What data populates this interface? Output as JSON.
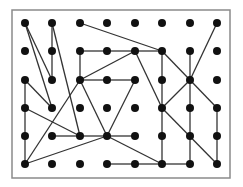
{
  "diagram": {
    "type": "grid-graph",
    "border": {
      "x": 12,
      "y": 10,
      "width": 218,
      "height": 168,
      "color": "#8a8a8a"
    },
    "node_color": "#111111",
    "edge_color": "#333333",
    "node_radius": 4,
    "columns": [
      25,
      52,
      80,
      107,
      135,
      162,
      190,
      217
    ],
    "rows": [
      23,
      51,
      80,
      108,
      136,
      164
    ],
    "edges": [
      [
        [
          0,
          0
        ],
        [
          1,
          2
        ]
      ],
      [
        [
          0,
          0
        ],
        [
          1,
          3
        ]
      ],
      [
        [
          1,
          0
        ],
        [
          1,
          1
        ]
      ],
      [
        [
          1,
          1
        ],
        [
          1,
          2
        ]
      ],
      [
        [
          1,
          0
        ],
        [
          2,
          4
        ]
      ],
      [
        [
          2,
          0
        ],
        [
          5,
          1
        ]
      ],
      [
        [
          2,
          1
        ],
        [
          3,
          1
        ]
      ],
      [
        [
          3,
          1
        ],
        [
          4,
          1
        ]
      ],
      [
        [
          4,
          1
        ],
        [
          5,
          1
        ]
      ],
      [
        [
          2,
          1
        ],
        [
          2,
          2
        ]
      ],
      [
        [
          2,
          2
        ],
        [
          3,
          2
        ]
      ],
      [
        [
          3,
          2
        ],
        [
          4,
          2
        ]
      ],
      [
        [
          2,
          2
        ],
        [
          4,
          1
        ]
      ],
      [
        [
          2,
          2
        ],
        [
          3,
          4
        ]
      ],
      [
        [
          2,
          2
        ],
        [
          0,
          5
        ]
      ],
      [
        [
          4,
          2
        ],
        [
          3,
          4
        ]
      ],
      [
        [
          4,
          1
        ],
        [
          5,
          3
        ]
      ],
      [
        [
          5,
          1
        ],
        [
          5,
          2
        ]
      ],
      [
        [
          5,
          2
        ],
        [
          5,
          3
        ]
      ],
      [
        [
          5,
          3
        ],
        [
          5,
          4
        ]
      ],
      [
        [
          5,
          4
        ],
        [
          5,
          5
        ]
      ],
      [
        [
          5,
          1
        ],
        [
          6,
          2
        ]
      ],
      [
        [
          7,
          0
        ],
        [
          6,
          2
        ]
      ],
      [
        [
          6,
          1
        ],
        [
          6,
          2
        ]
      ],
      [
        [
          6,
          2
        ],
        [
          6,
          3
        ]
      ],
      [
        [
          6,
          3
        ],
        [
          6,
          4
        ]
      ],
      [
        [
          6,
          4
        ],
        [
          6,
          5
        ]
      ],
      [
        [
          6,
          2
        ],
        [
          5,
          3
        ]
      ],
      [
        [
          6,
          2
        ],
        [
          7,
          3
        ]
      ],
      [
        [
          7,
          3
        ],
        [
          7,
          4
        ]
      ],
      [
        [
          7,
          4
        ],
        [
          7,
          5
        ]
      ],
      [
        [
          5,
          3
        ],
        [
          7,
          5
        ]
      ],
      [
        [
          0,
          2
        ],
        [
          0,
          3
        ]
      ],
      [
        [
          0,
          3
        ],
        [
          0,
          4
        ]
      ],
      [
        [
          0,
          4
        ],
        [
          0,
          5
        ]
      ],
      [
        [
          0,
          2
        ],
        [
          1,
          3
        ]
      ],
      [
        [
          0,
          3
        ],
        [
          2,
          4
        ]
      ],
      [
        [
          1,
          4
        ],
        [
          2,
          4
        ]
      ],
      [
        [
          2,
          4
        ],
        [
          3,
          4
        ]
      ],
      [
        [
          3,
          4
        ],
        [
          4,
          4
        ]
      ],
      [
        [
          0,
          5
        ],
        [
          3,
          4
        ]
      ],
      [
        [
          3,
          4
        ],
        [
          5,
          5
        ]
      ],
      [
        [
          3,
          5
        ],
        [
          4,
          5
        ]
      ],
      [
        [
          4,
          5
        ],
        [
          5,
          5
        ]
      ],
      [
        [
          5,
          5
        ],
        [
          6,
          5
        ]
      ]
    ]
  }
}
